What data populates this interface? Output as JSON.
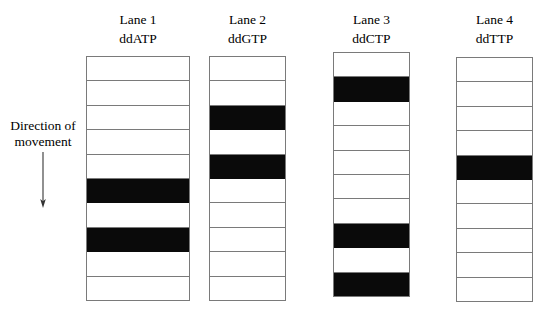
{
  "figure": {
    "type": "sanger-sequencing-gel-diagram",
    "background_color": "#ffffff",
    "band_color": "#0a0a0a",
    "outline_color": "#7a7a7a"
  },
  "direction_annotation": {
    "line1": "Direction of",
    "line2": "movement",
    "arrow_direction": "down",
    "arrow_icon": "arrow-down-icon"
  },
  "lanes": [
    {
      "title": "Lane 1",
      "subtitle": "ddATP",
      "rows": 10,
      "band_rows": [
        6,
        8
      ],
      "geometry": {
        "left": 86,
        "top": 56,
        "width": 104,
        "height": 245
      }
    },
    {
      "title": "Lane 2",
      "subtitle": "ddGTP",
      "rows": 10,
      "band_rows": [
        3,
        5
      ],
      "geometry": {
        "left": 209,
        "top": 56,
        "width": 77,
        "height": 245
      }
    },
    {
      "title": "Lane 3",
      "subtitle": "ddCTP",
      "rows": 10,
      "band_rows": [
        2,
        8,
        10
      ],
      "geometry": {
        "left": 333,
        "top": 52,
        "width": 77,
        "height": 245
      }
    },
    {
      "title": "Lane 4",
      "subtitle": "ddTTP",
      "rows": 10,
      "band_rows": [
        5
      ],
      "geometry": {
        "left": 456,
        "top": 57,
        "width": 77,
        "height": 245
      }
    }
  ]
}
